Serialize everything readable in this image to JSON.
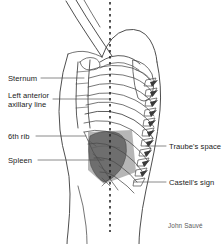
{
  "figure": {
    "signature": "John Sauvé",
    "colors": {
      "outline": "#3a3a3a",
      "bone_line": "#4a4a4a",
      "spleen_fill": "#6e6e6e",
      "traube_fill": "#a9a9a9",
      "leader_line": "#4a4a4a",
      "dashed_line": "#1a1a1a",
      "label_text": "#1a1a1a",
      "signature_text": "#5a5a5a",
      "background": "#ffffff"
    }
  },
  "labels": {
    "sternum": {
      "text": "Sternum",
      "x": 8,
      "y": 74
    },
    "axillary_line_1": {
      "text": "Left anterior",
      "x": 8,
      "y": 92
    },
    "axillary_line_2": {
      "text": "axillary line",
      "x": 8,
      "y": 101
    },
    "sixth_rib": {
      "text": "6th rib",
      "x": 8,
      "y": 132
    },
    "spleen": {
      "text": "Spleen",
      "x": 8,
      "y": 156
    },
    "traube_space": {
      "text": "Traube's space",
      "x": 168,
      "y": 142
    },
    "castell_sign": {
      "text": "Castell's sign",
      "x": 168,
      "y": 178
    }
  },
  "anatomy_parts": [
    "raised-left-arm",
    "shoulder",
    "clavicle",
    "scapula",
    "sternum",
    "rib-cage",
    "vertebral-column",
    "spleen",
    "traube-space",
    "abdomen-contour",
    "hip-contour"
  ]
}
